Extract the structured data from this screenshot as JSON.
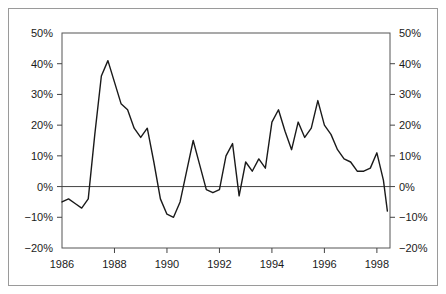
{
  "chart_data": {
    "type": "line",
    "title": "",
    "subtitle": "",
    "xlabel": "",
    "ylabel": "",
    "xlim": [
      1986.0,
      1998.5
    ],
    "ylim": [
      -20,
      50
    ],
    "grid": false,
    "legend": null,
    "axes": {
      "left": {
        "ticks": [
          -20,
          -10,
          0,
          10,
          20,
          30,
          40,
          50
        ],
        "tick_labels": [
          "−20%",
          "−10%",
          "0%",
          "10%",
          "20%",
          "30%",
          "40%",
          "50%"
        ]
      },
      "right": {
        "ticks": [
          -20,
          -10,
          0,
          10,
          20,
          30,
          40,
          50
        ],
        "tick_labels": [
          "−20%",
          "−10%",
          "0%",
          "10%",
          "20%",
          "30%",
          "40%",
          "50%"
        ]
      },
      "bottom": {
        "ticks": [
          1986,
          1988,
          1990,
          1992,
          1994,
          1996,
          1998
        ],
        "tick_labels": [
          "1986",
          "1988",
          "1990",
          "1992",
          "1994",
          "1996",
          "1998"
        ]
      }
    },
    "zero_line": 0,
    "series": [
      {
        "name": "series-1",
        "color": "#1a1a1a",
        "x": [
          1986.0,
          1986.25,
          1986.5,
          1986.75,
          1987.0,
          1987.25,
          1987.5,
          1987.75,
          1988.0,
          1988.25,
          1988.5,
          1988.75,
          1989.0,
          1989.25,
          1989.5,
          1989.75,
          1990.0,
          1990.25,
          1990.5,
          1990.75,
          1991.0,
          1991.25,
          1991.5,
          1991.75,
          1992.0,
          1992.25,
          1992.5,
          1992.75,
          1993.0,
          1993.25,
          1993.5,
          1993.75,
          1994.0,
          1994.25,
          1994.5,
          1994.75,
          1995.0,
          1995.25,
          1995.5,
          1995.75,
          1996.0,
          1996.25,
          1996.5,
          1996.75,
          1997.0,
          1997.25,
          1997.5,
          1997.75,
          1998.0,
          1998.25,
          1998.4
        ],
        "values": [
          -5.0,
          -4.0,
          -5.5,
          -7.0,
          -4.0,
          17.0,
          36.0,
          41.0,
          34.0,
          27.0,
          25.0,
          19.0,
          16.0,
          19.0,
          8.0,
          -4.0,
          -9.0,
          -10.0,
          -5.0,
          5.0,
          15.0,
          7.0,
          -1.0,
          -2.0,
          -1.0,
          10.0,
          14.0,
          -3.0,
          8.0,
          5.0,
          9.0,
          6.0,
          21.0,
          25.0,
          18.0,
          12.0,
          21.0,
          16.0,
          19.0,
          28.0,
          20.0,
          17.0,
          12.0,
          9.0,
          8.0,
          5.0,
          5.0,
          6.0,
          11.0,
          2.0,
          -8.0
        ]
      }
    ]
  }
}
